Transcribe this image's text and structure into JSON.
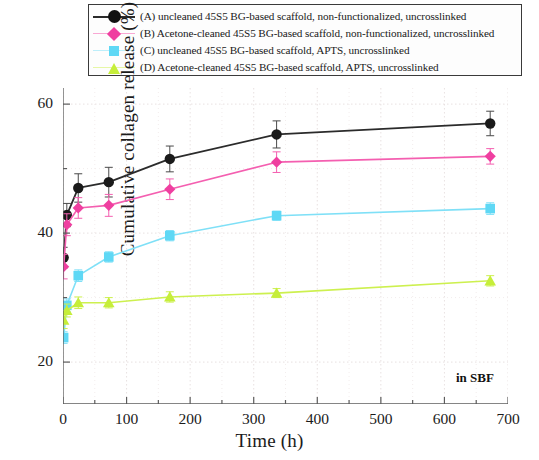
{
  "chart_data": {
    "type": "line",
    "title": "",
    "xlabel": "Time (h)",
    "ylabel": "Cumulative collagen release (%)",
    "xlim": [
      0,
      700
    ],
    "ylim": [
      13.5,
      62.5
    ],
    "xticks": [
      0,
      100,
      200,
      300,
      400,
      500,
      600,
      700
    ],
    "yticks": [
      20,
      40,
      60
    ],
    "x_minor_interval": 50,
    "y_minor_interval": 10,
    "grid": true,
    "legend_position": "top",
    "annotation": "in SBF",
    "x": [
      1,
      6,
      24,
      72,
      168,
      336,
      672
    ],
    "series": [
      {
        "key": "A",
        "name": "(A) uncleaned 45S5 BG-based scaffold, non-functionalized, uncrosslinked",
        "color": "#1a1a1a",
        "line_color": "#2b2b2b",
        "marker": "circle",
        "values": [
          36.2,
          42.8,
          47.0,
          47.9,
          51.5,
          55.3,
          57.0
        ],
        "errors": [
          1.6,
          1.8,
          2.2,
          2.3,
          2.0,
          2.1,
          1.9
        ]
      },
      {
        "key": "B",
        "name": "(B) Acetone-cleaned 45S5 BG-based scaffold, non-functionalized, uncrosslinked",
        "color": "#ef3fa0",
        "line_color": "#f45fb0",
        "marker": "diamond",
        "values": [
          34.8,
          41.3,
          43.9,
          44.3,
          46.8,
          51.0,
          51.9
        ],
        "errors": [
          1.9,
          1.7,
          1.6,
          1.7,
          1.6,
          1.6,
          1.2
        ]
      },
      {
        "key": "C",
        "name": "(C) uncleaned 45S5 BG-based scaffold, APTS, uncrosslinked",
        "color": "#5fd8f5",
        "line_color": "#7fe0f7",
        "marker": "square",
        "values": [
          23.8,
          28.8,
          33.4,
          36.3,
          39.6,
          42.7,
          43.8
        ],
        "errors": [
          0.9,
          1.0,
          0.9,
          0.8,
          0.8,
          0.7,
          0.9
        ]
      },
      {
        "key": "D",
        "name": "(D) Acetone-cleaned 45S5 BG-based scaffold, APTS, uncrosslinked",
        "color": "#c6ee3a",
        "line_color": "#cdf04f",
        "marker": "triangle",
        "values": [
          26.5,
          28.0,
          29.2,
          29.2,
          30.1,
          30.7,
          32.6
        ],
        "errors": [
          1.3,
          1.0,
          0.9,
          0.8,
          0.8,
          0.7,
          0.8
        ]
      }
    ]
  },
  "legend": {
    "items": [
      {
        "label": "(A) uncleaned 45S5 BG-based scaffold, non-functionalized, uncrosslinked"
      },
      {
        "label": "(B) Acetone-cleaned 45S5 BG-based scaffold, non-functionalized, uncrosslinked"
      },
      {
        "label": "(C) uncleaned 45S5 BG-based scaffold, APTS, uncrosslinked"
      },
      {
        "label": "(D) Acetone-cleaned 45S5 BG-based scaffold, APTS, uncrosslinked"
      }
    ]
  }
}
